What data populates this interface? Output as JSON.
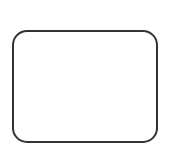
{
  "canvas": {
    "width": 170,
    "height": 152,
    "background": "#ffffff"
  },
  "shapes": [
    {
      "type": "rounded-rectangle",
      "x": 12,
      "y": 30,
      "width": 146,
      "height": 113,
      "corner_radius": 15,
      "stroke_color": "#333333",
      "stroke_width": 2,
      "fill": "none"
    }
  ]
}
